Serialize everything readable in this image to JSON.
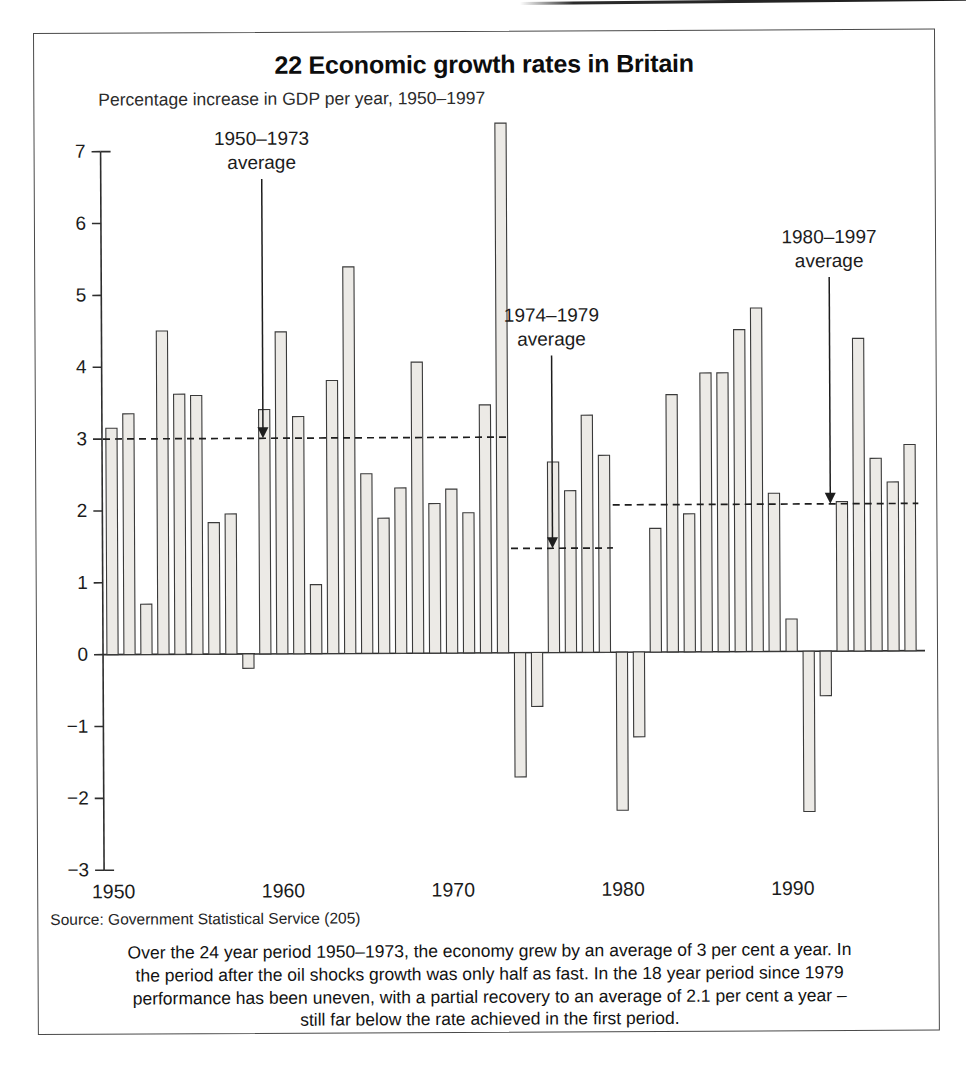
{
  "figure": {
    "title": "22 Economic growth rates in Britain",
    "subtitle": "Percentage increase in GDP per year, 1950–1997",
    "source": "Source: Government Statistical Service (205)",
    "caption_lines": [
      "Over the 24 year period 1950–1973, the economy grew by an average of 3 per cent a year. In",
      "the period after the oil shocks growth was only half as fast. In the 18 year period since 1979",
      "performance has been uneven, with a partial recovery to an average of 2.1 per cent a year –",
      "still far below the rate achieved in the first period."
    ]
  },
  "chart_data": {
    "type": "bar",
    "title": "22 Economic growth rates in Britain",
    "subtitle": "Percentage increase in GDP per year, 1950–1997",
    "xlabel": "",
    "ylabel": "Percentage increase in GDP per year",
    "ylim": [
      -3,
      7
    ],
    "ytick_labels": [
      "7",
      "6",
      "5",
      "4",
      "3",
      "2",
      "1",
      "0",
      "−1",
      "−2",
      "−3"
    ],
    "yticks": [
      7,
      6,
      5,
      4,
      3,
      2,
      1,
      0,
      -1,
      -2,
      -3
    ],
    "xtick_labels": [
      "1950",
      "1960",
      "1970",
      "1980",
      "1990"
    ],
    "xticks": [
      1950,
      1960,
      1970,
      1980,
      1990
    ],
    "grid": false,
    "legend": "none",
    "bar_fill": "#eceae6",
    "bar_stroke": "#3a3a3a",
    "categories": [
      1950,
      1951,
      1952,
      1953,
      1954,
      1955,
      1956,
      1957,
      1958,
      1959,
      1960,
      1961,
      1962,
      1963,
      1964,
      1965,
      1966,
      1967,
      1968,
      1969,
      1970,
      1971,
      1972,
      1973,
      1974,
      1975,
      1976,
      1977,
      1978,
      1979,
      1980,
      1981,
      1982,
      1983,
      1984,
      1985,
      1986,
      1987,
      1988,
      1989,
      1990,
      1991,
      1992,
      1993,
      1994,
      1995,
      1996,
      1997
    ],
    "values": [
      3.15,
      3.35,
      0.7,
      4.5,
      3.62,
      3.6,
      1.83,
      1.95,
      -0.2,
      3.4,
      4.48,
      3.3,
      0.96,
      3.8,
      5.38,
      2.5,
      1.88,
      2.3,
      4.05,
      2.08,
      2.28,
      1.95,
      3.45,
      7.37,
      -1.73,
      -0.75,
      2.65,
      2.25,
      3.3,
      2.74,
      -2.2,
      -1.18,
      1.72,
      3.58,
      1.92,
      3.88,
      3.88,
      4.48,
      4.78,
      2.2,
      0.45,
      -2.23,
      -0.62,
      2.08,
      4.35,
      2.68,
      2.35,
      2.87
    ],
    "reference_lines": [
      {
        "label": "1950–1973 average",
        "value": 3.0,
        "x_start": 1950,
        "x_end": 1973,
        "annotation_x": 1957,
        "arrow": true,
        "style": "dashed"
      },
      {
        "label": "1974–1979 average",
        "value": 1.45,
        "x_start": 1974,
        "x_end": 1979,
        "annotation_x": 1974,
        "arrow": true,
        "style": "dashed"
      },
      {
        "label": "1980–1997 average",
        "value": 2.05,
        "x_start": 1980,
        "x_end": 1997,
        "annotation_x": 1989,
        "arrow": true,
        "style": "dashed"
      }
    ],
    "annotations": [
      {
        "text_line1": "1950–1973",
        "text_line2": "average"
      },
      {
        "text_line1": "1974–1979",
        "text_line2": "average"
      },
      {
        "text_line1": "1980–1997",
        "text_line2": "average"
      }
    ]
  }
}
